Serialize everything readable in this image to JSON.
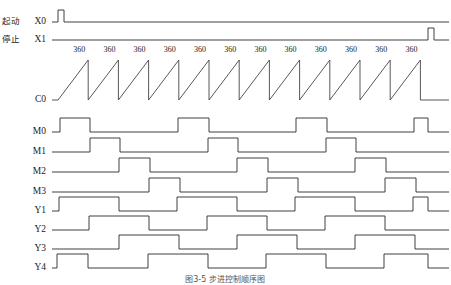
{
  "figure": {
    "caption": "图3-5  步进控制顺序图"
  },
  "layout": {
    "width": 451,
    "height": 285,
    "label_x": 46,
    "wave_start_x": 52,
    "wave_end_x": 449,
    "line_color": "#2b2b2b",
    "bg_color": "#ffffff"
  },
  "signals": [
    {
      "name": "X0",
      "cn_label": "起动",
      "row_baseline": 22,
      "high_offset": 12,
      "kind": "pulse",
      "pulses": [
        [
          58,
          64
        ]
      ]
    },
    {
      "name": "X1",
      "cn_label": "停止",
      "row_baseline": 40,
      "high_offset": 12,
      "kind": "pulse",
      "pulses": [
        [
          428,
          434
        ]
      ]
    },
    {
      "name": "C0",
      "cn_label": "",
      "row_baseline": 100,
      "high_offset": 40,
      "kind": "sawtooth",
      "ramp_start_x": 58,
      "period": 30.2,
      "cycles": 12,
      "peak_label": "360",
      "peak_label_y": 52,
      "tail_drop_x": 428
    },
    {
      "name": "M0",
      "cn_label": "",
      "row_baseline": 132,
      "high_offset": 14,
      "kind": "pulse",
      "pulses": [
        [
          60,
          90
        ],
        [
          178,
          209
        ],
        [
          296,
          327
        ],
        [
          414,
          428
        ]
      ]
    },
    {
      "name": "M1",
      "cn_label": "",
      "row_baseline": 152,
      "high_offset": 14,
      "kind": "pulse",
      "pulses": [
        [
          90,
          120
        ],
        [
          208,
          238
        ],
        [
          326,
          356
        ]
      ]
    },
    {
      "name": "M2",
      "cn_label": "",
      "row_baseline": 172,
      "high_offset": 14,
      "kind": "pulse",
      "pulses": [
        [
          119,
          150
        ],
        [
          237,
          268
        ],
        [
          355,
          386
        ]
      ]
    },
    {
      "name": "M3",
      "cn_label": "",
      "row_baseline": 192,
      "high_offset": 14,
      "kind": "pulse",
      "pulses": [
        [
          149,
          180
        ],
        [
          267,
          298
        ],
        [
          385,
          416
        ]
      ]
    },
    {
      "name": "Y1",
      "cn_label": "",
      "row_baseline": 211,
      "high_offset": 14,
      "kind": "pulse",
      "pulses": [
        [
          59,
          119
        ],
        [
          177,
          237
        ],
        [
          295,
          355
        ],
        [
          413,
          428
        ]
      ]
    },
    {
      "name": "Y2",
      "cn_label": "",
      "row_baseline": 230,
      "high_offset": 14,
      "kind": "pulse",
      "pulses": [
        [
          89,
          149
        ],
        [
          207,
          267
        ],
        [
          325,
          385
        ]
      ]
    },
    {
      "name": "Y3",
      "cn_label": "",
      "row_baseline": 249,
      "high_offset": 14,
      "kind": "pulse",
      "pulses": [
        [
          119,
          179
        ],
        [
          237,
          297
        ],
        [
          355,
          415
        ]
      ]
    },
    {
      "name": "Y4",
      "cn_label": "",
      "row_baseline": 268,
      "high_offset": 14,
      "kind": "pulse",
      "pulses": [
        [
          57,
          88
        ],
        [
          148,
          208
        ],
        [
          266,
          326
        ],
        [
          384,
          428
        ]
      ]
    }
  ],
  "chart_data": {
    "type": "line",
    "xlabel": "",
    "ylabel": "",
    "counter_preset": "360",
    "counter_peak_count": 12,
    "series": [
      {
        "name": "X0",
        "label_cn": "起动",
        "type": "digital",
        "pulse_count": 1
      },
      {
        "name": "X1",
        "label_cn": "停止",
        "type": "digital",
        "pulse_count": 1
      },
      {
        "name": "C0",
        "label_cn": "",
        "type": "sawtooth",
        "cycles": 12,
        "peak_value": "360"
      },
      {
        "name": "M0",
        "label_cn": "",
        "type": "digital",
        "pulse_count": 4
      },
      {
        "name": "M1",
        "label_cn": "",
        "type": "digital",
        "pulse_count": 3
      },
      {
        "name": "M2",
        "label_cn": "",
        "type": "digital",
        "pulse_count": 3
      },
      {
        "name": "M3",
        "label_cn": "",
        "type": "digital",
        "pulse_count": 3
      },
      {
        "name": "Y1",
        "label_cn": "",
        "type": "digital",
        "pulse_count": 4
      },
      {
        "name": "Y2",
        "label_cn": "",
        "type": "digital",
        "pulse_count": 3
      },
      {
        "name": "Y3",
        "label_cn": "",
        "type": "digital",
        "pulse_count": 3
      },
      {
        "name": "Y4",
        "label_cn": "",
        "type": "digital",
        "pulse_count": 4
      }
    ]
  }
}
